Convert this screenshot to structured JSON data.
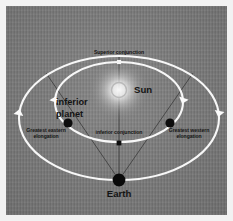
{
  "figure": {
    "kind": "astronomy-orbit-diagram",
    "background_color": "#7b7b7b",
    "orbit_color": "#f7f7f7",
    "sight_line_color": "#2a2a2a",
    "planet_color": "#0d0d0d",
    "earth_color": "#0a0a0a",
    "sun_label_color": "#141414"
  },
  "bodies": {
    "sun": {
      "label": "Sun",
      "cx": 113,
      "cy": 84,
      "r": 7.5,
      "glow_r": 30
    },
    "earth": {
      "label": "Earth",
      "cx": 113,
      "cy": 174,
      "r": 6.4
    }
  },
  "orbits": {
    "outer": {
      "name": "earth-orbit",
      "cx": 113,
      "cy": 112,
      "rx": 100,
      "ry": 62
    },
    "inner": {
      "name": "inferior-planet-orbit",
      "cx": 113,
      "cy": 96,
      "rx": 64,
      "ry": 40
    }
  },
  "positions": [
    {
      "id": "superior-conjunction",
      "label": "Superior conjunction",
      "cx": 113,
      "cy": 56,
      "marker": "square-light",
      "size": 4.2
    },
    {
      "id": "greatest-eastern-elongation",
      "label": "Greatest eastern\nelongation",
      "label_line1": "Greatest eastern",
      "label_line2": "elongation",
      "cx": 62,
      "cy": 117,
      "marker": "dot-dark",
      "size": 4.6
    },
    {
      "id": "greatest-western-elongation",
      "label": "Greatest western\nelongation",
      "label_line1": "Greatest western",
      "label_line2": "elongation",
      "cx": 164,
      "cy": 117,
      "marker": "dot-dark",
      "size": 4.6
    },
    {
      "id": "inferior-conjunction",
      "label": "inferior conjunction",
      "cx": 113,
      "cy": 137,
      "marker": "square-dark",
      "size": 4.8
    }
  ],
  "annotations": {
    "inferior_planet": {
      "line1": "inferior",
      "line2": "planet"
    }
  },
  "direction_arrows": [
    {
      "id": "outer-orbit-arrow-left",
      "x": 13,
      "y": 108,
      "rotation": 0
    },
    {
      "id": "outer-orbit-arrow-right",
      "x": 213,
      "y": 108,
      "rotation": 180
    },
    {
      "id": "inner-orbit-arrow-left",
      "x": 49,
      "y": 95,
      "rotation": 0
    },
    {
      "id": "inner-orbit-arrow-right",
      "x": 177,
      "y": 95,
      "rotation": 180
    }
  ],
  "sight_lines": [
    {
      "id": "earth-to-eastern-elongation",
      "x1": 113,
      "y1": 174,
      "x2": 40,
      "y2": 67
    },
    {
      "id": "earth-to-western-elongation",
      "x1": 113,
      "y1": 174,
      "x2": 187,
      "y2": 67
    },
    {
      "id": "sun-earth-axis",
      "x1": 113,
      "y1": 50,
      "x2": 113,
      "y2": 174
    }
  ]
}
